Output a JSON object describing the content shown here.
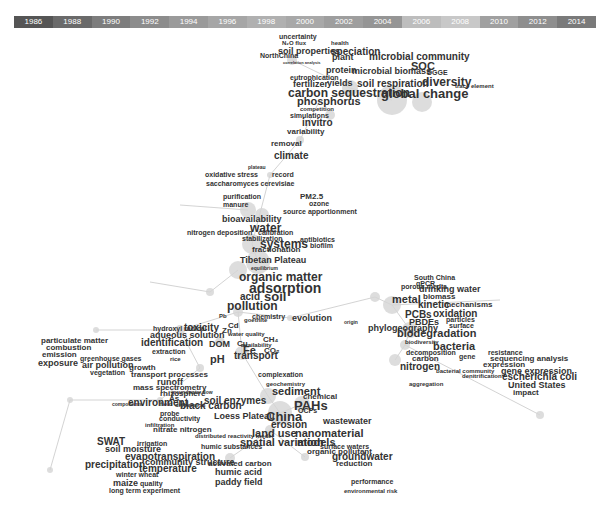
{
  "timeline": {
    "years": [
      "1986",
      "1988",
      "1990",
      "1992",
      "1994",
      "1996",
      "1998",
      "2000",
      "2002",
      "2004",
      "2006",
      "2008",
      "2010",
      "2012",
      "2014"
    ],
    "colors": [
      "#555555",
      "#6a6a6a",
      "#7d7d7d",
      "#8c8c8c",
      "#9a9a9a",
      "#a6a6a6",
      "#b0b0b0",
      "#a8a8a8",
      "#9e9e9e",
      "#959595",
      "#bdbdbd",
      "#c8c8c8",
      "#a0a0a0",
      "#8e8e8e",
      "#7a7a7a"
    ]
  },
  "nodes": [
    {
      "x": 292,
      "y": 60,
      "r": 5
    },
    {
      "x": 350,
      "y": 88,
      "r": 8
    },
    {
      "x": 392,
      "y": 100,
      "r": 15
    },
    {
      "x": 422,
      "y": 102,
      "r": 10
    },
    {
      "x": 330,
      "y": 115,
      "r": 5
    },
    {
      "x": 300,
      "y": 140,
      "r": 4
    },
    {
      "x": 270,
      "y": 175,
      "r": 3
    },
    {
      "x": 248,
      "y": 210,
      "r": 8
    },
    {
      "x": 262,
      "y": 215,
      "r": 7
    },
    {
      "x": 252,
      "y": 244,
      "r": 10
    },
    {
      "x": 258,
      "y": 262,
      "r": 12
    },
    {
      "x": 238,
      "y": 270,
      "r": 9
    },
    {
      "x": 210,
      "y": 292,
      "r": 4
    },
    {
      "x": 238,
      "y": 312,
      "r": 5
    },
    {
      "x": 290,
      "y": 318,
      "r": 3
    },
    {
      "x": 180,
      "y": 330,
      "r": 5
    },
    {
      "x": 220,
      "y": 342,
      "r": 5
    },
    {
      "x": 242,
      "y": 353,
      "r": 7
    },
    {
      "x": 200,
      "y": 368,
      "r": 4
    },
    {
      "x": 268,
      "y": 396,
      "r": 8
    },
    {
      "x": 302,
      "y": 404,
      "r": 8
    },
    {
      "x": 280,
      "y": 413,
      "r": 12
    },
    {
      "x": 270,
      "y": 430,
      "r": 5
    },
    {
      "x": 375,
      "y": 297,
      "r": 5
    },
    {
      "x": 392,
      "y": 305,
      "r": 9
    },
    {
      "x": 410,
      "y": 330,
      "r": 8
    },
    {
      "x": 395,
      "y": 360,
      "r": 6
    },
    {
      "x": 405,
      "y": 345,
      "r": 5
    },
    {
      "x": 540,
      "y": 415,
      "r": 4
    },
    {
      "x": 305,
      "y": 457,
      "r": 4
    },
    {
      "x": 230,
      "y": 458,
      "r": 5
    },
    {
      "x": 160,
      "y": 400,
      "r": 3
    },
    {
      "x": 70,
      "y": 400,
      "r": 3
    },
    {
      "x": 50,
      "y": 470,
      "r": 3
    },
    {
      "x": 96,
      "y": 330,
      "r": 3
    }
  ],
  "edges": [
    [
      292,
      60,
      350,
      88
    ],
    [
      350,
      88,
      392,
      100
    ],
    [
      300,
      140,
      270,
      175
    ],
    [
      270,
      175,
      252,
      244
    ],
    [
      252,
      244,
      258,
      262
    ],
    [
      238,
      270,
      210,
      292
    ],
    [
      238,
      312,
      290,
      318
    ],
    [
      290,
      318,
      375,
      297
    ],
    [
      375,
      297,
      392,
      305
    ],
    [
      392,
      305,
      410,
      330
    ],
    [
      410,
      330,
      405,
      345
    ],
    [
      405,
      345,
      395,
      360
    ],
    [
      242,
      353,
      268,
      396
    ],
    [
      268,
      396,
      280,
      413
    ],
    [
      280,
      413,
      302,
      404
    ],
    [
      280,
      413,
      270,
      430
    ],
    [
      270,
      430,
      305,
      457
    ],
    [
      270,
      430,
      230,
      458
    ],
    [
      238,
      312,
      242,
      353
    ],
    [
      238,
      312,
      180,
      330
    ],
    [
      180,
      330,
      96,
      330
    ],
    [
      180,
      330,
      200,
      368
    ],
    [
      200,
      368,
      160,
      400
    ],
    [
      160,
      400,
      70,
      400
    ],
    [
      70,
      400,
      50,
      470
    ],
    [
      405,
      345,
      540,
      415
    ],
    [
      392,
      305,
      500,
      300
    ],
    [
      210,
      292,
      150,
      282
    ],
    [
      248,
      210,
      180,
      205
    ],
    [
      300,
      140,
      320,
      100
    ]
  ],
  "keywords": [
    {
      "t": "uncertainty",
      "x": 279,
      "y": 33,
      "s": 7
    },
    {
      "t": "N₂O flux",
      "x": 282,
      "y": 40,
      "s": 6
    },
    {
      "t": "health",
      "x": 331,
      "y": 40,
      "s": 6
    },
    {
      "t": "soil properties",
      "x": 278,
      "y": 47,
      "s": 9
    },
    {
      "t": "speciation",
      "x": 331,
      "y": 47,
      "s": 10
    },
    {
      "t": "NorthChina",
      "x": 260,
      "y": 52,
      "s": 7
    },
    {
      "t": "plant",
      "x": 332,
      "y": 53,
      "s": 9
    },
    {
      "t": "correlation analysis",
      "x": 283,
      "y": 61,
      "s": 4
    },
    {
      "t": "microbial community",
      "x": 369,
      "y": 52,
      "s": 10
    },
    {
      "t": "SOC",
      "x": 411,
      "y": 61,
      "s": 11
    },
    {
      "t": "protein",
      "x": 326,
      "y": 66,
      "s": 9
    },
    {
      "t": "microbial biomass",
      "x": 352,
      "y": 67,
      "s": 9
    },
    {
      "t": "DGGE",
      "x": 427,
      "y": 69,
      "s": 7
    },
    {
      "t": "eutrophication",
      "x": 290,
      "y": 74,
      "s": 7
    },
    {
      "t": "fertilizer",
      "x": 293,
      "y": 80,
      "s": 9
    },
    {
      "t": "yields",
      "x": 327,
      "y": 79,
      "s": 9
    },
    {
      "t": "soil respiration",
      "x": 357,
      "y": 79,
      "s": 10
    },
    {
      "t": "diversity",
      "x": 422,
      "y": 76,
      "s": 12
    },
    {
      "t": "trace element",
      "x": 455,
      "y": 83,
      "s": 6
    },
    {
      "t": "carbon sequestration",
      "x": 288,
      "y": 87,
      "s": 12
    },
    {
      "t": "global change",
      "x": 381,
      "y": 87,
      "s": 13
    },
    {
      "t": "phosphorus",
      "x": 297,
      "y": 96,
      "s": 11
    },
    {
      "t": "competition",
      "x": 300,
      "y": 106,
      "s": 6
    },
    {
      "t": "simulations",
      "x": 290,
      "y": 112,
      "s": 7
    },
    {
      "t": "invitro",
      "x": 302,
      "y": 118,
      "s": 10
    },
    {
      "t": "variability",
      "x": 287,
      "y": 128,
      "s": 8
    },
    {
      "t": "removal",
      "x": 271,
      "y": 140,
      "s": 8
    },
    {
      "t": "climate",
      "x": 274,
      "y": 151,
      "s": 10
    },
    {
      "t": "plateau",
      "x": 248,
      "y": 165,
      "s": 5
    },
    {
      "t": "oxidative stress",
      "x": 205,
      "y": 171,
      "s": 7
    },
    {
      "t": "record",
      "x": 272,
      "y": 171,
      "s": 7
    },
    {
      "t": "saccharomyces cerevisiae",
      "x": 206,
      "y": 180,
      "s": 7
    },
    {
      "t": "purification",
      "x": 223,
      "y": 193,
      "s": 7
    },
    {
      "t": "PM2.5",
      "x": 300,
      "y": 193,
      "s": 8
    },
    {
      "t": "ozone",
      "x": 309,
      "y": 200,
      "s": 7
    },
    {
      "t": "manure",
      "x": 223,
      "y": 201,
      "s": 7
    },
    {
      "t": "source apportionment",
      "x": 283,
      "y": 208,
      "s": 7
    },
    {
      "t": "bioavailability",
      "x": 222,
      "y": 215,
      "s": 9
    },
    {
      "t": "water",
      "x": 250,
      "y": 222,
      "s": 12
    },
    {
      "t": "nitrogen deposition",
      "x": 187,
      "y": 229,
      "s": 7
    },
    {
      "t": "calibration",
      "x": 258,
      "y": 229,
      "s": 7
    },
    {
      "t": "stabilization",
      "x": 242,
      "y": 235,
      "s": 7
    },
    {
      "t": "systems",
      "x": 260,
      "y": 238,
      "s": 12
    },
    {
      "t": "antibiotics",
      "x": 300,
      "y": 236,
      "s": 7
    },
    {
      "t": "biofilm",
      "x": 310,
      "y": 242,
      "s": 7
    },
    {
      "t": "fractionation",
      "x": 252,
      "y": 246,
      "s": 8
    },
    {
      "t": "Tibetan Plateau",
      "x": 240,
      "y": 256,
      "s": 9
    },
    {
      "t": "equilibrium",
      "x": 251,
      "y": 266,
      "s": 5
    },
    {
      "t": "organic matter",
      "x": 239,
      "y": 271,
      "s": 12
    },
    {
      "t": "adsorption",
      "x": 249,
      "y": 281,
      "s": 14
    },
    {
      "t": "acid",
      "x": 240,
      "y": 292,
      "s": 10
    },
    {
      "t": "soil",
      "x": 264,
      "y": 290,
      "s": 13
    },
    {
      "t": "pollution",
      "x": 227,
      "y": 300,
      "s": 12
    },
    {
      "t": "goethite",
      "x": 244,
      "y": 317,
      "s": 6
    },
    {
      "t": "hydroxyl radical",
      "x": 153,
      "y": 325,
      "s": 7
    },
    {
      "t": "aqueous solution",
      "x": 150,
      "y": 331,
      "s": 9
    },
    {
      "t": "identification",
      "x": 141,
      "y": 338,
      "s": 10
    },
    {
      "t": "DOM",
      "x": 209,
      "y": 340,
      "s": 9
    },
    {
      "t": "availability",
      "x": 241,
      "y": 342,
      "s": 6
    },
    {
      "t": "extraction",
      "x": 152,
      "y": 348,
      "s": 7
    },
    {
      "t": "rice",
      "x": 170,
      "y": 356,
      "s": 6
    },
    {
      "t": "pH",
      "x": 210,
      "y": 354,
      "s": 11
    },
    {
      "t": "transport",
      "x": 234,
      "y": 351,
      "s": 10
    },
    {
      "t": "particulate matter",
      "x": 41,
      "y": 337,
      "s": 8
    },
    {
      "t": "combustion",
      "x": 46,
      "y": 344,
      "s": 8
    },
    {
      "t": "emission",
      "x": 42,
      "y": 351,
      "s": 8
    },
    {
      "t": "greenhouse gases",
      "x": 80,
      "y": 355,
      "s": 7
    },
    {
      "t": "exposure",
      "x": 38,
      "y": 359,
      "s": 9
    },
    {
      "t": "air pollution",
      "x": 82,
      "y": 361,
      "s": 9
    },
    {
      "t": "growth",
      "x": 129,
      "y": 364,
      "s": 8
    },
    {
      "t": "vegetation",
      "x": 90,
      "y": 369,
      "s": 7
    },
    {
      "t": "transport processes",
      "x": 131,
      "y": 371,
      "s": 8
    },
    {
      "t": "runoff",
      "x": 157,
      "y": 378,
      "s": 9
    },
    {
      "t": "mass spectrometry",
      "x": 133,
      "y": 384,
      "s": 8
    },
    {
      "t": "rhizosphere",
      "x": 160,
      "y": 390,
      "s": 8
    },
    {
      "t": "As",
      "x": 169,
      "y": 395,
      "s": 8
    },
    {
      "t": "environment",
      "x": 128,
      "y": 398,
      "s": 10
    },
    {
      "t": "components",
      "x": 112,
      "y": 402,
      "s": 5
    },
    {
      "t": "dispersion",
      "x": 175,
      "y": 402,
      "s": 6
    },
    {
      "t": "Pb",
      "x": 219,
      "y": 313,
      "s": 6
    },
    {
      "t": "chemistry",
      "x": 252,
      "y": 313,
      "s": 7
    },
    {
      "t": "evolution",
      "x": 292,
      "y": 314,
      "s": 9
    },
    {
      "t": "origin",
      "x": 344,
      "y": 320,
      "s": 5
    },
    {
      "t": "toxicity",
      "x": 184,
      "y": 323,
      "s": 10
    },
    {
      "t": "Cd",
      "x": 228,
      "y": 322,
      "s": 8
    },
    {
      "t": "Zn",
      "x": 222,
      "y": 327,
      "s": 8
    },
    {
      "t": "water quality",
      "x": 228,
      "y": 331,
      "s": 6
    },
    {
      "t": "CH₄",
      "x": 263,
      "y": 336,
      "s": 8
    },
    {
      "t": "Cu",
      "x": 237,
      "y": 340,
      "s": 8
    },
    {
      "t": "Fe",
      "x": 243,
      "y": 345,
      "s": 11
    },
    {
      "t": "CO₂",
      "x": 264,
      "y": 347,
      "s": 8
    },
    {
      "t": "porous media",
      "x": 401,
      "y": 283,
      "s": 7
    },
    {
      "t": "South China",
      "x": 414,
      "y": 274,
      "s": 7
    },
    {
      "t": "qPCR",
      "x": 416,
      "y": 280,
      "s": 7
    },
    {
      "t": "drinking water",
      "x": 419,
      "y": 285,
      "s": 9
    },
    {
      "t": "metal",
      "x": 392,
      "y": 294,
      "s": 11
    },
    {
      "t": "biomass",
      "x": 423,
      "y": 293,
      "s": 8
    },
    {
      "t": "kinetic",
      "x": 418,
      "y": 300,
      "s": 10
    },
    {
      "t": "mechanisms",
      "x": 444,
      "y": 301,
      "s": 8
    },
    {
      "t": "PCBs",
      "x": 405,
      "y": 310,
      "s": 10
    },
    {
      "t": "oxidation",
      "x": 433,
      "y": 309,
      "s": 10
    },
    {
      "t": "PBDEs",
      "x": 409,
      "y": 318,
      "s": 9
    },
    {
      "t": "particles",
      "x": 446,
      "y": 316,
      "s": 7
    },
    {
      "t": "surface",
      "x": 449,
      "y": 322,
      "s": 7
    },
    {
      "t": "phylogeography",
      "x": 368,
      "y": 324,
      "s": 9
    },
    {
      "t": "biodegradation",
      "x": 397,
      "y": 328,
      "s": 11
    },
    {
      "t": "biodiversity",
      "x": 405,
      "y": 339,
      "s": 6
    },
    {
      "t": "bacteria",
      "x": 433,
      "y": 341,
      "s": 11
    },
    {
      "t": "decomposition",
      "x": 406,
      "y": 349,
      "s": 7
    },
    {
      "t": "carbon",
      "x": 412,
      "y": 355,
      "s": 8
    },
    {
      "t": "gene",
      "x": 459,
      "y": 353,
      "s": 7
    },
    {
      "t": "resistance",
      "x": 488,
      "y": 349,
      "s": 7
    },
    {
      "t": "sequencing analysis",
      "x": 490,
      "y": 355,
      "s": 8
    },
    {
      "t": "nitrogen",
      "x": 400,
      "y": 362,
      "s": 10
    },
    {
      "t": "expression",
      "x": 483,
      "y": 361,
      "s": 8
    },
    {
      "t": "gene expression",
      "x": 501,
      "y": 367,
      "s": 9
    },
    {
      "t": "escherichia coli",
      "x": 502,
      "y": 372,
      "s": 10
    },
    {
      "t": "bacterial community",
      "x": 436,
      "y": 368,
      "s": 6
    },
    {
      "t": "denitrification",
      "x": 462,
      "y": 373,
      "s": 6
    },
    {
      "t": "aggregation",
      "x": 409,
      "y": 381,
      "s": 6
    },
    {
      "t": "United States",
      "x": 508,
      "y": 381,
      "s": 9
    },
    {
      "t": "impact",
      "x": 513,
      "y": 389,
      "s": 8
    },
    {
      "t": "complexation",
      "x": 258,
      "y": 371,
      "s": 7
    },
    {
      "t": "geochemistry",
      "x": 266,
      "y": 381,
      "s": 6
    },
    {
      "t": "sediment",
      "x": 272,
      "y": 386,
      "s": 11
    },
    {
      "t": "chemical",
      "x": 303,
      "y": 393,
      "s": 8
    },
    {
      "t": "PAHs",
      "x": 294,
      "y": 399,
      "s": 13
    },
    {
      "t": "groundwater flow",
      "x": 171,
      "y": 390,
      "s": 5
    },
    {
      "t": "soil enzymes",
      "x": 204,
      "y": 396,
      "s": 10
    },
    {
      "t": "field",
      "x": 160,
      "y": 401,
      "s": 6
    },
    {
      "t": "black carbon",
      "x": 180,
      "y": 401,
      "s": 10
    },
    {
      "t": "OCPs",
      "x": 298,
      "y": 407,
      "s": 7
    },
    {
      "t": "Loess Plateau",
      "x": 214,
      "y": 412,
      "s": 9
    },
    {
      "t": "China",
      "x": 266,
      "y": 410,
      "s": 13
    },
    {
      "t": "probe",
      "x": 160,
      "y": 410,
      "s": 7
    },
    {
      "t": "conductivity",
      "x": 159,
      "y": 415,
      "s": 7
    },
    {
      "t": "wastewater",
      "x": 323,
      "y": 417,
      "s": 9
    },
    {
      "t": "erosion",
      "x": 271,
      "y": 420,
      "s": 10
    },
    {
      "t": "infiltration",
      "x": 145,
      "y": 422,
      "s": 6
    },
    {
      "t": "nitrate nitrogen",
      "x": 153,
      "y": 426,
      "s": 8
    },
    {
      "t": "land use",
      "x": 252,
      "y": 428,
      "s": 11
    },
    {
      "t": "nanomaterial",
      "x": 295,
      "y": 428,
      "s": 11
    },
    {
      "t": "distributed reactivity model",
      "x": 195,
      "y": 433,
      "s": 6
    },
    {
      "t": "spatial variation",
      "x": 240,
      "y": 437,
      "s": 11
    },
    {
      "t": "models",
      "x": 297,
      "y": 437,
      "s": 11
    },
    {
      "t": "humic substances",
      "x": 201,
      "y": 443,
      "s": 7
    },
    {
      "t": "SWAT",
      "x": 97,
      "y": 437,
      "s": 10
    },
    {
      "t": "irrigation",
      "x": 137,
      "y": 440,
      "s": 7
    },
    {
      "t": "soil moisture",
      "x": 105,
      "y": 445,
      "s": 9
    },
    {
      "t": "surface waters",
      "x": 320,
      "y": 443,
      "s": 7
    },
    {
      "t": "organic pollutant",
      "x": 307,
      "y": 448,
      "s": 8
    },
    {
      "t": "evapotranspiration",
      "x": 125,
      "y": 452,
      "s": 10
    },
    {
      "t": "groundwater",
      "x": 332,
      "y": 452,
      "s": 10
    },
    {
      "t": "community structure",
      "x": 145,
      "y": 458,
      "s": 9
    },
    {
      "t": "activated carbon",
      "x": 208,
      "y": 460,
      "s": 8
    },
    {
      "t": "reduction",
      "x": 336,
      "y": 460,
      "s": 8
    },
    {
      "t": "precipitation",
      "x": 85,
      "y": 460,
      "s": 10
    },
    {
      "t": "temperature",
      "x": 139,
      "y": 464,
      "s": 10
    },
    {
      "t": "humic acid",
      "x": 215,
      "y": 468,
      "s": 9
    },
    {
      "t": "winter wheat",
      "x": 116,
      "y": 471,
      "s": 7
    },
    {
      "t": "maize",
      "x": 113,
      "y": 479,
      "s": 9
    },
    {
      "t": "quality",
      "x": 140,
      "y": 480,
      "s": 7
    },
    {
      "t": "paddy field",
      "x": 215,
      "y": 478,
      "s": 9
    },
    {
      "t": "performance",
      "x": 351,
      "y": 478,
      "s": 7
    },
    {
      "t": "long term experiment",
      "x": 109,
      "y": 487,
      "s": 7
    },
    {
      "t": "environmental risk",
      "x": 344,
      "y": 488,
      "s": 6
    }
  ]
}
